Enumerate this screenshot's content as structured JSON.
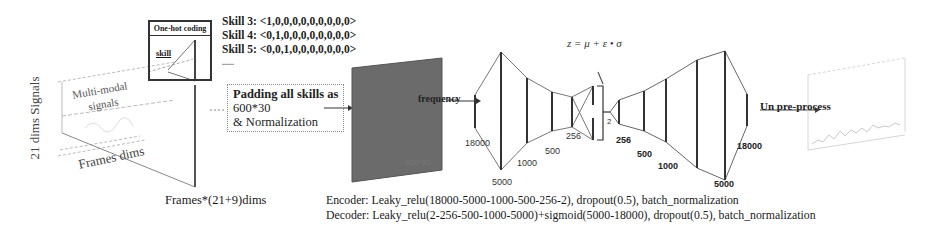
{
  "input_panel": {
    "vertical_label": "21 dims Signals",
    "multimodal_label_line1": "Multi-modal",
    "multimodal_label_line2": "signals",
    "frames_label": "Frames dims",
    "bottom_label": "Frames*(21+9)dims"
  },
  "onehot_box": {
    "title": "One-hot coding",
    "inner_label": "skill"
  },
  "skill_vectors": [
    "Skill 3: <1,0,0,0,0,0,0,0,0,0>",
    "Skill 4: <0,1,0,0,0,0,0,0,0,0>",
    "Skill 5: <0,0,1,0,0,0,0,0,0,0>",
    "......"
  ],
  "padding_box": {
    "line1": "Padding all skills as",
    "line2": "600*30",
    "line3": "& Normalization"
  },
  "matrix": {
    "label": "600*30",
    "color": "#6b6b6b"
  },
  "arrow_label": "frequency",
  "vae": {
    "formula": "z = μ + ε • σ",
    "encoder_layers": [
      "18000",
      "5000",
      "1000",
      "500",
      "256"
    ],
    "latent": "2",
    "decoder_layers": [
      "256",
      "500",
      "1000",
      "5000",
      "18000"
    ]
  },
  "output_label": "Un pre-process",
  "captions": {
    "encoder": "Encoder: Leaky_relu(18000-5000-1000-500-256-2), dropout(0.5), batch_normalization",
    "decoder": "Decoder: Leaky_relu(2-256-500-1000-5000)+sigmoid(5000-18000), dropout(0.5), batch_normalization"
  }
}
